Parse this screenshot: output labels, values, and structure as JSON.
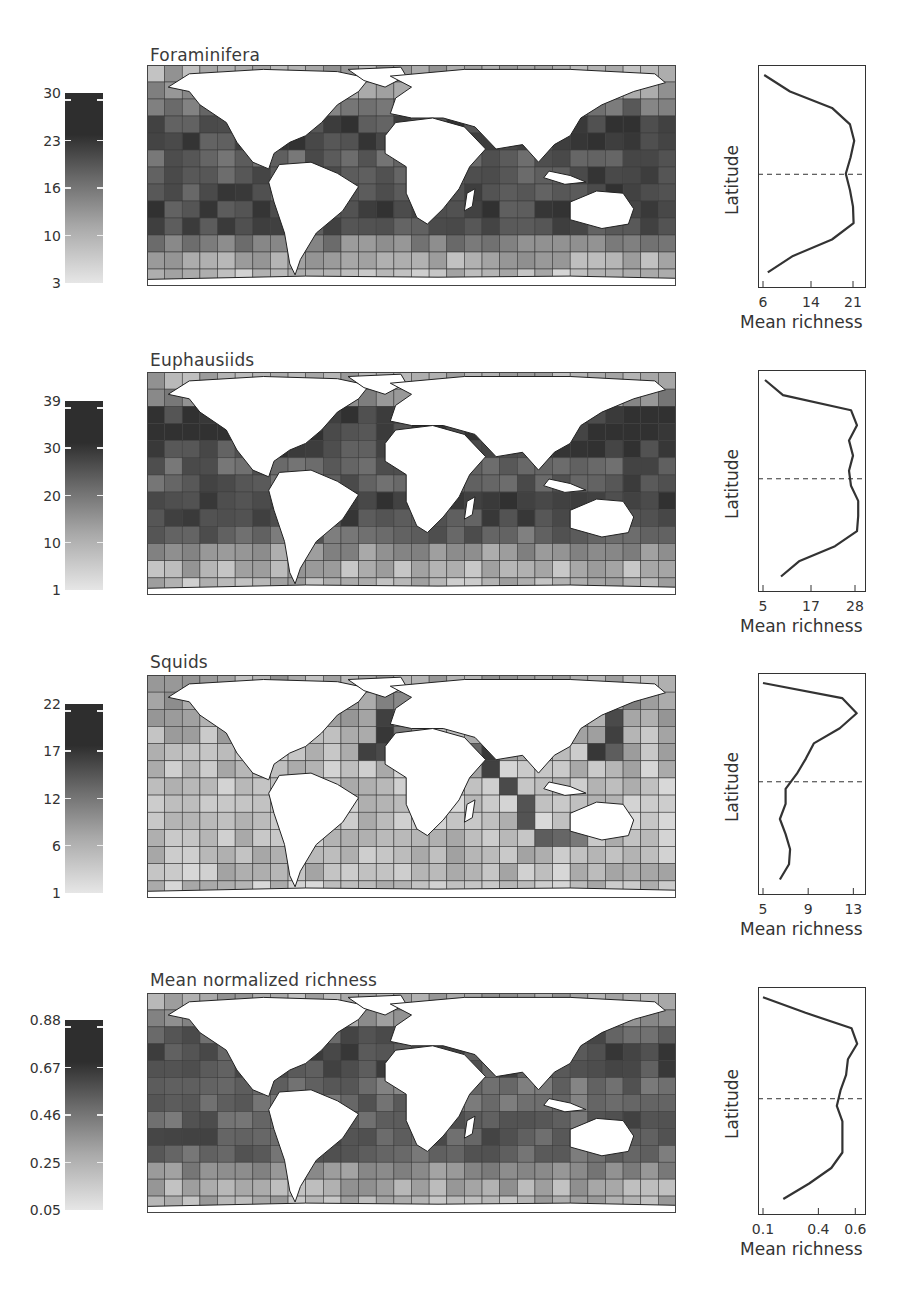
{
  "panels": [
    {
      "title": "Foraminifera",
      "colorbar": {
        "ticks": [
          "30",
          "23",
          "16",
          "10",
          "3"
        ],
        "min": 3,
        "max": 30
      },
      "profile": {
        "ylabel": "Latitude",
        "xlabel": "Mean richness",
        "xticks": [
          "6",
          "14",
          "21"
        ]
      }
    },
    {
      "title": "Euphausiids",
      "colorbar": {
        "ticks": [
          "39",
          "30",
          "20",
          "10",
          "1"
        ],
        "min": 1,
        "max": 39
      },
      "profile": {
        "ylabel": "Latitude",
        "xlabel": "Mean richness",
        "xticks": [
          "5",
          "17",
          "28"
        ]
      }
    },
    {
      "title": "Squids",
      "colorbar": {
        "ticks": [
          "22",
          "17",
          "12",
          "6",
          "1"
        ],
        "min": 1,
        "max": 22
      },
      "profile": {
        "ylabel": "Latitude",
        "xlabel": "Mean richness",
        "xticks": [
          "5",
          "9",
          "13"
        ]
      }
    },
    {
      "title": "Mean normalized richness",
      "colorbar": {
        "ticks": [
          "0.88",
          "0.67",
          "0.46",
          "0.25",
          "0.05"
        ],
        "min": 0.05,
        "max": 0.88
      },
      "profile": {
        "ylabel": "Latitude",
        "xlabel": "Mean richness",
        "xticks": [
          "0.1",
          "0.4",
          "0.6"
        ]
      }
    }
  ],
  "chart_data": [
    {
      "type": "heatmap",
      "title": "Foraminifera",
      "description": "Global gridded species richness map (grayscale, darker = higher)",
      "colorbar_ticks": [
        30,
        23,
        16,
        10,
        3
      ],
      "value_range": [
        3,
        30
      ],
      "pattern": "high richness (dark) in tropical/subtropical bands ~40N-40S, low at high latitudes"
    },
    {
      "type": "line",
      "title": "Foraminifera latitudinal profile",
      "xlabel": "Mean richness",
      "ylabel": "Latitude",
      "xticks": [
        6,
        14,
        21
      ],
      "xlim": [
        6,
        22
      ],
      "equator_dashed_line": true,
      "latitude_top_to_bottom": [
        "90N",
        "75N",
        "60N",
        "45N",
        "30N",
        "15N",
        "0",
        "-15",
        "-30",
        "-45",
        "-60",
        "-75"
      ],
      "values_top_to_bottom": [
        6.2,
        10.5,
        17.5,
        20.5,
        21.2,
        20.6,
        19.8,
        20.5,
        21.0,
        21.1,
        17.5,
        11.0,
        6.8
      ]
    },
    {
      "type": "heatmap",
      "title": "Euphausiids",
      "colorbar_ticks": [
        39,
        30,
        20,
        10,
        1
      ],
      "value_range": [
        1,
        39
      ],
      "pattern": "very high richness in mid-latitude North Pacific/Atlantic and Indian Ocean; low in Southern Ocean"
    },
    {
      "type": "line",
      "title": "Euphausiids latitudinal profile",
      "xlabel": "Mean richness",
      "ylabel": "Latitude",
      "xticks": [
        5,
        17,
        28
      ],
      "xlim": [
        5,
        29
      ],
      "equator_dashed_line": true,
      "values_top_to_bottom": [
        5.5,
        10.0,
        27.0,
        28.5,
        26.5,
        27.5,
        26.5,
        27.0,
        28.8,
        28.8,
        28.5,
        23.0,
        14.0,
        9.5
      ]
    },
    {
      "type": "heatmap",
      "title": "Squids",
      "colorbar_ticks": [
        22,
        17,
        12,
        6,
        1
      ],
      "value_range": [
        1,
        22
      ],
      "pattern": "highest richness in western North Atlantic, NW Pacific (Japan) and West Africa coasts; generally low in open ocean"
    },
    {
      "type": "line",
      "title": "Squids latitudinal profile",
      "xlabel": "Mean richness",
      "ylabel": "Latitude",
      "xticks": [
        5,
        9,
        13
      ],
      "xlim": [
        5,
        13.5
      ],
      "equator_dashed_line": true,
      "values_top_to_bottom": [
        5.0,
        12.0,
        13.3,
        11.8,
        9.5,
        8.8,
        8.0,
        7.0,
        7.0,
        6.5,
        7.0,
        7.4,
        7.3,
        6.5
      ]
    },
    {
      "type": "heatmap",
      "title": "Mean normalized richness",
      "colorbar_ticks": [
        0.88,
        0.67,
        0.46,
        0.25,
        0.05
      ],
      "value_range": [
        0.05,
        0.88
      ],
      "pattern": "high normalized richness across subtropical oceans and North Atlantic; low in polar regions"
    },
    {
      "type": "line",
      "title": "Mean normalized richness latitudinal profile",
      "xlabel": "Mean richness",
      "ylabel": "Latitude",
      "xticks": [
        0.1,
        0.4,
        0.6
      ],
      "xlim": [
        0.1,
        0.62
      ],
      "equator_dashed_line": true,
      "values_top_to_bottom": [
        0.1,
        0.33,
        0.58,
        0.61,
        0.56,
        0.55,
        0.52,
        0.5,
        0.53,
        0.53,
        0.53,
        0.47,
        0.35,
        0.21
      ]
    }
  ]
}
